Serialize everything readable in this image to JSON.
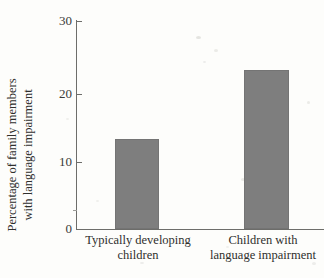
{
  "chart_data": {
    "type": "bar",
    "title": "",
    "subtitle": "",
    "xlabel": "",
    "ylabel_lines": [
      "Percentage of family members",
      "with language impairment"
    ],
    "ylabel": "Percentage of family members with language impairment",
    "categories": [
      "Typically developing children",
      "Children with language impairment"
    ],
    "category_lines": [
      [
        "Typically developing",
        "children"
      ],
      [
        "Children with",
        "language impairment"
      ]
    ],
    "values": [
      13,
      23
    ],
    "ylim": [
      0,
      30
    ],
    "yticks": [
      0,
      10,
      20,
      30
    ],
    "ytick_labels": [
      "0",
      "10",
      "20",
      "30"
    ],
    "grid": false,
    "legend": null,
    "legend_position": "none",
    "annotations": [],
    "bar_color": "#7e7e7e",
    "axis_color": "#6d6d6a",
    "background_color": "#fdfdfb"
  },
  "axis": {
    "tick_0": "0",
    "tick_10": "10",
    "tick_20": "20",
    "tick_30": "30"
  },
  "labels": {
    "y_line_1": "Percentage of family members",
    "y_line_2": "with language impairment",
    "cat_1_line_1": "Typically developing",
    "cat_1_line_2": "children",
    "cat_2_line_1": "Children with",
    "cat_2_line_2": "language impairment"
  }
}
